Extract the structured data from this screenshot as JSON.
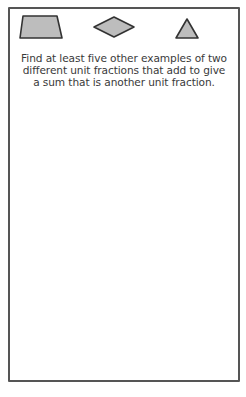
{
  "card": {
    "shapes": [
      {
        "name": "trapezoid",
        "fill": "#bdbdbd",
        "stroke": "#333333"
      },
      {
        "name": "rhombus",
        "fill": "#bdbdbd",
        "stroke": "#333333"
      },
      {
        "name": "triangle",
        "fill": "#bdbdbd",
        "stroke": "#333333"
      }
    ],
    "prompt": "Find at least five other examples of two different unit fractions that add to give a sum that is another unit fraction."
  },
  "colors": {
    "border": "#555555",
    "shape_fill": "#bdbdbd",
    "shape_stroke": "#333333",
    "text": "#3a3a3a"
  }
}
